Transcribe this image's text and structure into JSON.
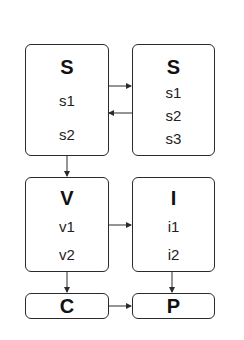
{
  "diagram": {
    "nodes": [
      {
        "id": "S_left",
        "title": "S",
        "items": [
          "s1",
          "s2"
        ]
      },
      {
        "id": "S_right",
        "title": "S",
        "items": [
          "s1",
          "s2",
          "s3"
        ]
      },
      {
        "id": "V",
        "title": "V",
        "items": [
          "v1",
          "v2"
        ]
      },
      {
        "id": "I",
        "title": "I",
        "items": [
          "i1",
          "i2"
        ]
      },
      {
        "id": "C",
        "title": "C",
        "items": []
      },
      {
        "id": "P",
        "title": "P",
        "items": []
      }
    ],
    "edges": [
      {
        "from": "S_left",
        "to": "S_right"
      },
      {
        "from": "S_right",
        "to": "S_left"
      },
      {
        "from": "S_left",
        "to": "V"
      },
      {
        "from": "V",
        "to": "I"
      },
      {
        "from": "V",
        "to": "C"
      },
      {
        "from": "I",
        "to": "P"
      },
      {
        "from": "C",
        "to": "P"
      }
    ],
    "colors": {
      "stroke": "#2a2a2a",
      "background": "#ffffff",
      "text": "#111111"
    }
  }
}
